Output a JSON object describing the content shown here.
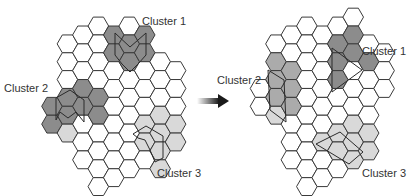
{
  "colors": {
    "white": "#ffffff",
    "dark": "#8c8c8c",
    "medium": "#ababab",
    "light": "#d9d9d9",
    "stroke": "#3a3a3a",
    "arrow": "#1a1a1a"
  },
  "hex": {
    "side": 10.3,
    "col_pitch": 15.45,
    "row_pitch": 17.84
  },
  "panels": [
    {
      "name": "before",
      "origin": [
        52,
        17.1
      ],
      "labels": [
        {
          "text": "Cluster 1",
          "x": 142,
          "y": 25
        },
        {
          "text": "Cluster 2",
          "x": 4,
          "y": 92
        },
        {
          "text": "Cluster 3",
          "x": 157,
          "y": 177
        }
      ],
      "columns": [
        {
          "c": 0,
          "rows": [
            [
              5,
              "dark"
            ],
            [
              6,
              "dark"
            ]
          ]
        },
        {
          "c": 1,
          "rows": [
            [
              1,
              "white"
            ],
            [
              2,
              "white"
            ],
            [
              3,
              "white"
            ],
            [
              4,
              "dark"
            ],
            [
              5,
              "dark"
            ],
            [
              6,
              "light"
            ]
          ]
        },
        {
          "c": 2,
          "rows": [
            [
              1,
              "white"
            ],
            [
              2,
              "white"
            ],
            [
              3,
              "white"
            ],
            [
              4,
              "dark"
            ],
            [
              5,
              "dark"
            ],
            [
              6,
              "white"
            ],
            [
              7,
              "white"
            ],
            [
              8,
              "white"
            ]
          ]
        },
        {
          "c": 3,
          "rows": [
            [
              0,
              "white"
            ],
            [
              1,
              "white"
            ],
            [
              2,
              "white"
            ],
            [
              3,
              "white"
            ],
            [
              4,
              "dark"
            ],
            [
              5,
              "dark"
            ],
            [
              6,
              "white"
            ],
            [
              7,
              "white"
            ],
            [
              8,
              "white"
            ],
            [
              9,
              "white"
            ]
          ]
        },
        {
          "c": 4,
          "rows": [
            [
              1,
              "dark"
            ],
            [
              2,
              "dark"
            ],
            [
              3,
              "white"
            ],
            [
              4,
              "white"
            ],
            [
              5,
              "white"
            ],
            [
              6,
              "white"
            ],
            [
              7,
              "white"
            ],
            [
              8,
              "white"
            ],
            [
              9,
              "white"
            ]
          ]
        },
        {
          "c": 5,
          "rows": [
            [
              0,
              "white"
            ],
            [
              1,
              "dark"
            ],
            [
              2,
              "dark"
            ],
            [
              3,
              "white"
            ],
            [
              4,
              "white"
            ],
            [
              5,
              "white"
            ],
            [
              6,
              "white"
            ],
            [
              7,
              "white"
            ],
            [
              8,
              "white"
            ]
          ]
        },
        {
          "c": 6,
          "rows": [
            [
              1,
              "dark"
            ],
            [
              2,
              "dark"
            ],
            [
              3,
              "white"
            ],
            [
              4,
              "white"
            ],
            [
              5,
              "white"
            ],
            [
              6,
              "light"
            ],
            [
              7,
              "light"
            ],
            [
              8,
              "white"
            ]
          ]
        },
        {
          "c": 7,
          "rows": [
            [
              2,
              "white"
            ],
            [
              3,
              "white"
            ],
            [
              4,
              "white"
            ],
            [
              5,
              "light"
            ],
            [
              6,
              "light"
            ],
            [
              7,
              "light"
            ],
            [
              8,
              "light"
            ]
          ]
        },
        {
          "c": 8,
          "rows": [
            [
              3,
              "white"
            ],
            [
              4,
              "white"
            ],
            [
              5,
              "white"
            ],
            [
              6,
              "light"
            ],
            [
              7,
              "light"
            ]
          ]
        }
      ],
      "paths": [
        {
          "cluster": "Cluster 1",
          "points": [
            [
              115,
              33
            ],
            [
              130,
              47
            ],
            [
              146,
              33
            ],
            [
              146,
              55
            ],
            [
              138,
              64
            ],
            [
              130,
              72
            ],
            [
              122,
              64
            ],
            [
              115,
              55
            ],
            [
              115,
              33
            ]
          ]
        },
        {
          "cluster": "Cluster 2",
          "points": [
            [
              56,
              98
            ],
            [
              70,
              90
            ],
            [
              84,
              100
            ],
            [
              84,
              122
            ],
            [
              76,
              112
            ],
            [
              68,
              118
            ],
            [
              60,
              112
            ],
            [
              56,
              120
            ],
            [
              56,
              98
            ]
          ]
        },
        {
          "cluster": "Cluster 3",
          "points": [
            [
              133,
              134
            ],
            [
              146,
              126
            ],
            [
              163,
              136
            ],
            [
              163,
              158
            ],
            [
              155,
              162
            ],
            [
              150,
              150
            ],
            [
              145,
              140
            ],
            [
              138,
              138
            ],
            [
              133,
              134
            ]
          ]
        }
      ]
    },
    {
      "name": "after",
      "origin": [
        260.5,
        17.1
      ],
      "labels": [
        {
          "text": "Cluster 1",
          "x": 362,
          "y": 55
        },
        {
          "text": "Cluster 2",
          "x": 217,
          "y": 84
        },
        {
          "text": "Cluster 3",
          "x": 362,
          "y": 177
        }
      ],
      "columns": [
        {
          "c": 0,
          "rows": [
            [
              4,
              "white"
            ],
            [
              5,
              "white"
            ]
          ]
        },
        {
          "c": 1,
          "rows": [
            [
              1,
              "white"
            ],
            [
              2,
              "medium"
            ],
            [
              3,
              "medium"
            ],
            [
              4,
              "medium"
            ],
            [
              5,
              "light"
            ]
          ]
        },
        {
          "c": 2,
          "rows": [
            [
              1,
              "white"
            ],
            [
              2,
              "white"
            ],
            [
              3,
              "medium"
            ],
            [
              4,
              "medium"
            ],
            [
              5,
              "medium"
            ],
            [
              6,
              "white"
            ],
            [
              7,
              "white"
            ],
            [
              8,
              "white"
            ]
          ]
        },
        {
          "c": 3,
          "rows": [
            [
              0,
              "white"
            ],
            [
              1,
              "white"
            ],
            [
              2,
              "white"
            ],
            [
              3,
              "white"
            ],
            [
              4,
              "white"
            ],
            [
              5,
              "white"
            ],
            [
              6,
              "white"
            ],
            [
              7,
              "white"
            ],
            [
              8,
              "white"
            ],
            [
              9,
              "white"
            ]
          ]
        },
        {
          "c": 4,
          "rows": [
            [
              1,
              "white"
            ],
            [
              2,
              "white"
            ],
            [
              3,
              "white"
            ],
            [
              4,
              "white"
            ],
            [
              5,
              "white"
            ],
            [
              6,
              "white"
            ],
            [
              7,
              "light"
            ],
            [
              8,
              "white"
            ],
            [
              9,
              "white"
            ]
          ]
        },
        {
          "c": 5,
          "rows": [
            [
              0,
              "white"
            ],
            [
              1,
              "dark"
            ],
            [
              2,
              "dark"
            ],
            [
              3,
              "dark"
            ],
            [
              4,
              "white"
            ],
            [
              5,
              "white"
            ],
            [
              6,
              "light"
            ],
            [
              7,
              "light"
            ],
            [
              8,
              "white"
            ]
          ]
        },
        {
          "c": 6,
          "rows": [
            [
              0,
              "white"
            ],
            [
              1,
              "dark"
            ],
            [
              2,
              "dark"
            ],
            [
              3,
              "white"
            ],
            [
              4,
              "white"
            ],
            [
              5,
              "white"
            ],
            [
              6,
              "light"
            ],
            [
              7,
              "light"
            ],
            [
              8,
              "light"
            ]
          ]
        },
        {
          "c": 7,
          "rows": [
            [
              1,
              "white"
            ],
            [
              2,
              "dark"
            ],
            [
              3,
              "white"
            ],
            [
              4,
              "white"
            ],
            [
              5,
              "white"
            ],
            [
              6,
              "light"
            ],
            [
              7,
              "light"
            ]
          ]
        },
        {
          "c": 8,
          "rows": [
            [
              2,
              "white"
            ],
            [
              3,
              "white"
            ],
            [
              4,
              "white"
            ]
          ]
        }
      ],
      "paths": [
        {
          "cluster": "Cluster 1",
          "points": [
            [
              332,
              48
            ],
            [
              362,
              70
            ],
            [
              332,
              92
            ],
            [
              332,
              48
            ]
          ]
        },
        {
          "cluster": "Cluster 2",
          "points": [
            [
              268,
              70
            ],
            [
              284,
              80
            ],
            [
              286,
              122
            ],
            [
              270,
              110
            ],
            [
              268,
              70
            ]
          ]
        },
        {
          "cluster": "Cluster 3",
          "points": [
            [
              316,
              144
            ],
            [
              340,
              132
            ],
            [
              363,
              152
            ],
            [
              349,
              164
            ],
            [
              316,
              144
            ]
          ]
        }
      ]
    }
  ],
  "arrow": {
    "x1": 197,
    "x2": 229,
    "y": 101
  }
}
